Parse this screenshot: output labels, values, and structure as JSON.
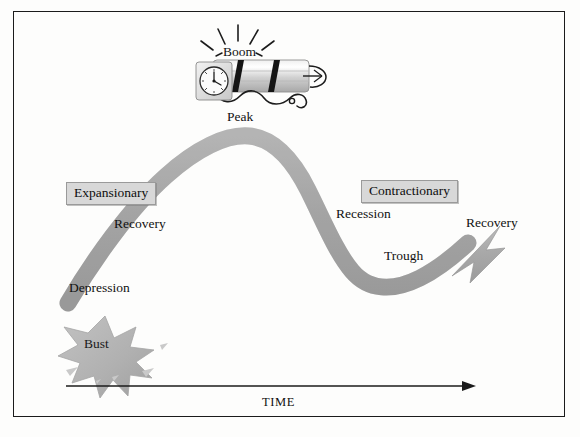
{
  "diagram": {
    "frame": {
      "border_color": "#1b1b1b"
    },
    "colors": {
      "curve_gray": "#a9a9a9",
      "curve_gray_dark": "#9a9a9a",
      "starburst_gray": "#b3b3b3",
      "box_fill": "#d8d8d8",
      "box_border": "#9a9a9a",
      "axis_black": "#1b1b1b",
      "text_black": "#111111"
    },
    "phase_boxes": [
      {
        "label": "Expansionary"
      },
      {
        "label": "Contractionary"
      }
    ],
    "stage_labels": [
      {
        "name": "peak",
        "label": "Peak"
      },
      {
        "name": "recovery-left",
        "label": "Recovery"
      },
      {
        "name": "depression",
        "label": "Depression"
      },
      {
        "name": "recession",
        "label": "Recession"
      },
      {
        "name": "trough",
        "label": "Trough"
      },
      {
        "name": "recovery-right",
        "label": "Recovery"
      }
    ],
    "event_labels": [
      {
        "name": "boom",
        "label": "Boom"
      },
      {
        "name": "bust",
        "label": "Bust"
      }
    ],
    "axis": {
      "label": "TIME",
      "direction": "right"
    },
    "icons": {
      "dynamite": "dynamite-icon",
      "alarm_clock": "alarm-clock-icon",
      "fuse": "fuse-icon",
      "sparks": "spark-lines-icon",
      "starburst": "starburst-icon",
      "debris": "debris-icon",
      "cycle_arrow": "business-cycle-arrow-icon",
      "time_arrow": "time-axis-arrow-icon"
    }
  }
}
